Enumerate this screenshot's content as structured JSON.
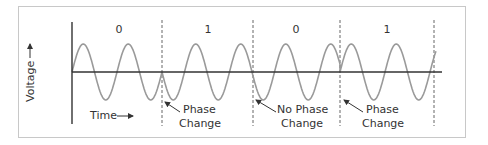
{
  "diagram": {
    "y_axis_label": "Voltage",
    "x_axis_label": "Time",
    "bits": [
      {
        "label": "0",
        "x": 119
      },
      {
        "label": "1",
        "x": 208
      },
      {
        "label": "0",
        "x": 296
      },
      {
        "label": "1",
        "x": 387
      }
    ],
    "boundaries": [
      162,
      253,
      340,
      434
    ],
    "annotations": [
      {
        "line1": "Phase",
        "line2": "Change",
        "x": 183,
        "arrow_from": [
          180,
          112
        ],
        "arrow_to": [
          165,
          102
        ]
      },
      {
        "line1": "No Phase",
        "line2": "Change",
        "x": 266,
        "arrow_from": [
          276,
          112
        ],
        "arrow_to": [
          256,
          102
        ]
      },
      {
        "line1": "Phase",
        "line2": "Change",
        "x": 362,
        "arrow_from": [
          363,
          112
        ],
        "arrow_to": [
          344,
          102
        ]
      }
    ],
    "colors": {
      "axis": "#333333",
      "wave": "#9a9a9a",
      "dashed": "#555555",
      "frame": "#c8c8c8",
      "text": "#333333"
    }
  }
}
